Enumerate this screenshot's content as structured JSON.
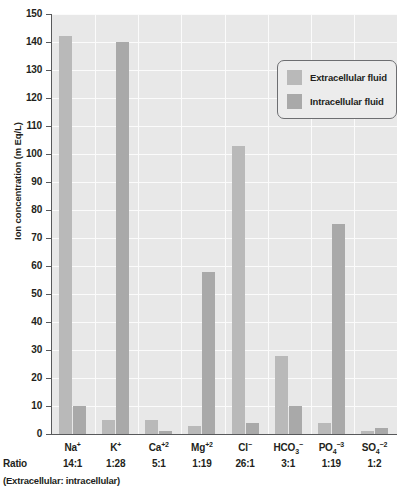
{
  "chart_data": {
    "type": "bar",
    "title": "",
    "xlabel": "",
    "ylabel": "Ion concentration (m Eq/L)",
    "ylim": [
      0,
      150
    ],
    "ytick_step": 10,
    "yticks": [
      150,
      140,
      130,
      120,
      110,
      100,
      90,
      80,
      70,
      60,
      50,
      40,
      30,
      20,
      10,
      0
    ],
    "grid": true,
    "legend_position": "upper-right-inset",
    "categories": [
      "Na",
      "K",
      "Ca",
      "Mg",
      "Cl",
      "HCO3",
      "PO4",
      "SO4"
    ],
    "category_labels": [
      {
        "base": "Na",
        "sub": "",
        "sup": "+"
      },
      {
        "base": "K",
        "sub": "",
        "sup": "+"
      },
      {
        "base": "Ca",
        "sub": "",
        "sup": "+2"
      },
      {
        "base": "Mg",
        "sub": "",
        "sup": "+2"
      },
      {
        "base": "Cl",
        "sub": "",
        "sup": "−"
      },
      {
        "base": "HCO",
        "sub": "3",
        "sup": "−"
      },
      {
        "base": "PO",
        "sub": "4",
        "sup": "−3"
      },
      {
        "base": "SO",
        "sub": "4",
        "sup": "−2"
      }
    ],
    "series": [
      {
        "name": "Extracellular fluid",
        "color": "#b9b9b9",
        "values": [
          142,
          5,
          5,
          3,
          103,
          28,
          4,
          1
        ]
      },
      {
        "name": "Intracellular fluid",
        "color": "#a9a9a9",
        "values": [
          10,
          140,
          1,
          58,
          4,
          10,
          75,
          2
        ]
      }
    ],
    "ratios": [
      "14:1",
      "1:28",
      "5:1",
      "1:19",
      "26:1",
      "3:1",
      "1:19",
      "1:2"
    ],
    "ratio_row_label": "Ratio",
    "ratio_note": "(Extracellular: intracellular)"
  },
  "legend": {
    "items": [
      {
        "label": "Extracellular fluid"
      },
      {
        "label": "Intracellular fluid"
      }
    ]
  },
  "colors": {
    "extracellular": "#b9b9b9",
    "intracellular": "#a9a9a9",
    "plot_background": "#e8e8e8",
    "gridline": "#fbfbfb",
    "axis": "#58595b",
    "text": "#231f20"
  }
}
